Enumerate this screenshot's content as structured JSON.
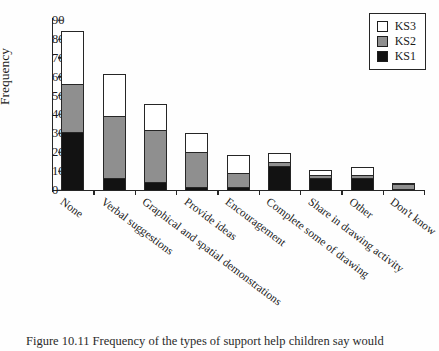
{
  "figure": {
    "ylabel": "Frequency",
    "caption": "Figure 10.11   Frequency of the types of support help children say would"
  },
  "legend": {
    "position": "top-right",
    "entries": [
      {
        "label": "KS3",
        "color": "#ffffff"
      },
      {
        "label": "KS2",
        "color": "#8f8f8f"
      },
      {
        "label": "KS1",
        "color": "#121212"
      }
    ]
  },
  "chart_data": {
    "type": "bar",
    "stacked": true,
    "title": "",
    "xlabel": "",
    "ylabel": "Frequency",
    "ylim": [
      0,
      90
    ],
    "yticks": [
      0,
      10,
      20,
      30,
      40,
      50,
      60,
      70,
      80,
      90
    ],
    "grid": false,
    "legend_position": "top-right",
    "categories": [
      "None",
      "Verbal suggestions",
      "Graphical and spatial demonstrations",
      "Provide ideas",
      "Encouragement",
      "Complete some of drawing",
      "Share in drawing activity",
      "Other",
      "Don't know"
    ],
    "series": [
      {
        "name": "KS1",
        "color": "#121212",
        "values": [
          31,
          7,
          5,
          2,
          2,
          13,
          7,
          7,
          1
        ]
      },
      {
        "name": "KS2",
        "color": "#8f8f8f",
        "values": [
          26,
          33,
          28,
          19,
          8,
          3,
          2,
          2,
          3
        ]
      },
      {
        "name": "KS3",
        "color": "#ffffff",
        "values": [
          29,
          23,
          14,
          11,
          10,
          5,
          3,
          5,
          1
        ]
      }
    ],
    "totals": [
      86,
      63,
      47,
      32,
      20,
      21,
      12,
      14,
      5
    ]
  }
}
